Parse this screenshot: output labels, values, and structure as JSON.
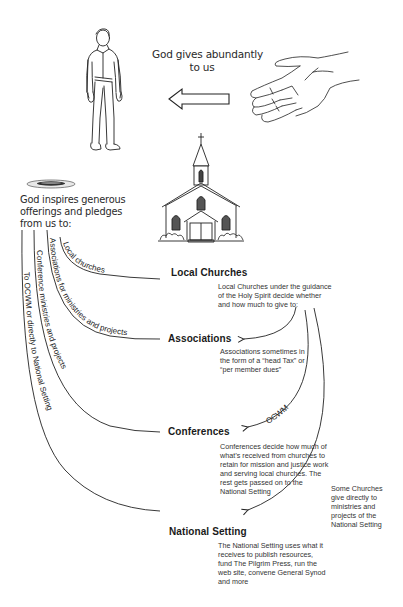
{
  "top": {
    "god_gives_line1": "God gives abundantly",
    "god_gives_line2": "to us"
  },
  "offering": {
    "line1": "God inspires generous",
    "line2": "offerings and pledges",
    "line3": "from us to:"
  },
  "flow_labels": {
    "local": "Local churches",
    "associations": "Associations for ministries and projects",
    "conferences": "Conference ministries and projects",
    "national": "To OCWM or directly to National Setting",
    "ocwm": "OCWM"
  },
  "nodes": [
    {
      "heading": "Local Churches",
      "desc": [
        "Local Churches under the guidance",
        "of the Holy Spirit decide whether",
        "and how much to give to:"
      ]
    },
    {
      "heading": "Associations",
      "desc": [
        "Associations sometimes in",
        "the form of a “head Tax” or",
        "“per member dues”"
      ]
    },
    {
      "heading": "Conferences",
      "desc": [
        "Conferences decide how much of",
        "what’s received from churches to",
        "retain for mission and justice work",
        "and serving local churches. The",
        "rest gets passed on to the",
        "National Setting"
      ]
    },
    {
      "heading": "National Setting",
      "desc": [
        "The National Setting uses what it",
        "receives to publish resources,",
        "fund The Pilgrim Press, run the",
        "web site, convene General Synod",
        "and more"
      ]
    }
  ],
  "side_note": [
    "Some Churches",
    "give directly to",
    "ministries and",
    "projects of the",
    "National Setting"
  ],
  "illustrations": {
    "person": "man-standing",
    "hand": "open-hand",
    "church": "church-building",
    "plate": "offering-plate"
  },
  "colors": {
    "ink": "#1a1a1a",
    "text": "#2a2a2a",
    "background": "#ffffff"
  }
}
